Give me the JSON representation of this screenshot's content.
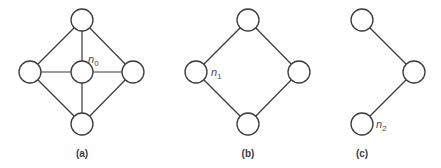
{
  "node_radius": 11,
  "colors": {
    "stroke": "#3a3a3a",
    "fill": "#ffffff",
    "label": "#4a4a4a"
  },
  "panels": [
    {
      "id": "a",
      "caption": "(a)",
      "caption_pos": [
        82,
        157
      ],
      "nodes": [
        {
          "id": "a-top",
          "x": 82,
          "y": 20
        },
        {
          "id": "a-left",
          "x": 30,
          "y": 72
        },
        {
          "id": "a-center",
          "x": 82,
          "y": 72,
          "label": "n",
          "sub": "0",
          "label_pos": [
            88,
            63
          ]
        },
        {
          "id": "a-right",
          "x": 133,
          "y": 72
        },
        {
          "id": "a-bottom",
          "x": 82,
          "y": 124
        }
      ],
      "edges": [
        [
          "a-top",
          "a-left"
        ],
        [
          "a-top",
          "a-center"
        ],
        [
          "a-top",
          "a-right"
        ],
        [
          "a-left",
          "a-center"
        ],
        [
          "a-center",
          "a-right"
        ],
        [
          "a-left",
          "a-bottom"
        ],
        [
          "a-center",
          "a-bottom"
        ],
        [
          "a-right",
          "a-bottom"
        ]
      ]
    },
    {
      "id": "b",
      "caption": "(b)",
      "caption_pos": [
        248,
        157
      ],
      "nodes": [
        {
          "id": "b-top",
          "x": 248,
          "y": 20
        },
        {
          "id": "b-left",
          "x": 196,
          "y": 72,
          "label": "n",
          "sub": "1",
          "label_pos": [
            211,
            76
          ]
        },
        {
          "id": "b-right",
          "x": 299,
          "y": 72
        },
        {
          "id": "b-bottom",
          "x": 248,
          "y": 124
        }
      ],
      "edges": [
        [
          "b-top",
          "b-left"
        ],
        [
          "b-top",
          "b-right"
        ],
        [
          "b-left",
          "b-bottom"
        ],
        [
          "b-right",
          "b-bottom"
        ]
      ]
    },
    {
      "id": "c",
      "caption": "(c)",
      "caption_pos": [
        362,
        157
      ],
      "nodes": [
        {
          "id": "c-top",
          "x": 362,
          "y": 20
        },
        {
          "id": "c-right",
          "x": 414,
          "y": 72
        },
        {
          "id": "c-bottom",
          "x": 362,
          "y": 124,
          "label": "n",
          "sub": "2",
          "label_pos": [
            376,
            128
          ]
        }
      ],
      "edges": [
        [
          "c-top",
          "c-right"
        ],
        [
          "c-right",
          "c-bottom"
        ]
      ]
    }
  ]
}
